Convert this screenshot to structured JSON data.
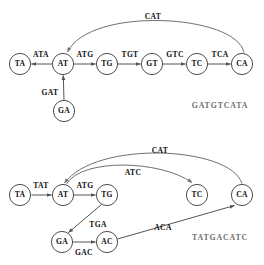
{
  "figure": {
    "background": "#ffffff",
    "node_stroke": "#3a3a3a",
    "edge_color": "#555555",
    "curve_color": "#707070",
    "sequence_color": "#6e6e6e"
  },
  "graphs": [
    {
      "id": "top-graph",
      "result_sequence": "GATGTCATA",
      "nodes": [
        {
          "id": "t-TA",
          "label": "TA",
          "x": 20,
          "y": 64
        },
        {
          "id": "t-AT",
          "label": "AT",
          "x": 63,
          "y": 64
        },
        {
          "id": "t-TG",
          "label": "TG",
          "x": 107,
          "y": 64
        },
        {
          "id": "t-GT",
          "label": "GT",
          "x": 152,
          "y": 64
        },
        {
          "id": "t-TC",
          "label": "TC",
          "x": 197,
          "y": 64
        },
        {
          "id": "t-CA",
          "label": "CA",
          "x": 242,
          "y": 64
        },
        {
          "id": "t-GA",
          "label": "GA",
          "x": 64,
          "y": 111
        }
      ],
      "edges": [
        {
          "id": "t-e1",
          "label": "ATA",
          "from": "AT",
          "to": "TA",
          "label_x": 41,
          "label_y": 55
        },
        {
          "id": "t-e2",
          "label": "ATG",
          "from": "AT",
          "to": "TG",
          "label_x": 85,
          "label_y": 55
        },
        {
          "id": "t-e3",
          "label": "TGT",
          "from": "TG",
          "to": "GT",
          "label_x": 130,
          "label_y": 55
        },
        {
          "id": "t-e4",
          "label": "GTC",
          "from": "GT",
          "to": "TC",
          "label_x": 175,
          "label_y": 55
        },
        {
          "id": "t-e5",
          "label": "TCA",
          "from": "TC",
          "to": "CA",
          "label_x": 220,
          "label_y": 55
        },
        {
          "id": "t-e6",
          "label": "GAT",
          "from": "GA",
          "to": "AT",
          "label_x": 50,
          "label_y": 93
        },
        {
          "id": "t-e7",
          "label": "CAT",
          "from": "CA",
          "to": "AT",
          "label_x": 153,
          "label_y": 17
        }
      ],
      "sequence_x": 220,
      "sequence_y": 106
    },
    {
      "id": "bottom-graph",
      "result_sequence": "TATGACATC",
      "nodes": [
        {
          "id": "b-TA",
          "label": "TA",
          "x": 20,
          "y": 195
        },
        {
          "id": "b-AT",
          "label": "AT",
          "x": 63,
          "y": 195
        },
        {
          "id": "b-TG",
          "label": "TG",
          "x": 107,
          "y": 195
        },
        {
          "id": "b-TC",
          "label": "TC",
          "x": 197,
          "y": 195
        },
        {
          "id": "b-CA",
          "label": "CA",
          "x": 242,
          "y": 195
        },
        {
          "id": "b-GA",
          "label": "GA",
          "x": 62,
          "y": 242
        },
        {
          "id": "b-AC",
          "label": "AC",
          "x": 107,
          "y": 242
        }
      ],
      "edges": [
        {
          "id": "b-e1",
          "label": "TAT",
          "from": "TA",
          "to": "AT",
          "label_x": 41,
          "label_y": 186
        },
        {
          "id": "b-e2",
          "label": "ATG",
          "from": "AT",
          "to": "TG",
          "label_x": 85,
          "label_y": 186
        },
        {
          "id": "b-e3",
          "label": "TGA",
          "from": "TG",
          "to": "GA",
          "label_x": 98,
          "label_y": 225
        },
        {
          "id": "b-e4",
          "label": "GAC",
          "from": "GA",
          "to": "AC",
          "label_x": 84,
          "label_y": 253
        },
        {
          "id": "b-e5",
          "label": "ACA",
          "from": "AC",
          "to": "CA",
          "label_x": 163,
          "label_y": 228
        },
        {
          "id": "b-e6",
          "label": "ATC",
          "from": "AT",
          "to": "TC",
          "label_x": 133,
          "label_y": 173
        },
        {
          "id": "b-e7",
          "label": "CAT",
          "from": "CA",
          "to": "AT",
          "label_x": 160,
          "label_y": 151
        }
      ],
      "sequence_x": 220,
      "sequence_y": 238
    }
  ]
}
